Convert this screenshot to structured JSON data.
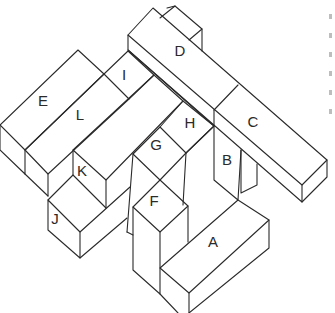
{
  "diagram": {
    "type": "isometric-block-arrangement",
    "blocks": [
      {
        "id": "A",
        "label": "A",
        "x": 213,
        "y": 243
      },
      {
        "id": "B",
        "label": "B",
        "x": 227,
        "y": 161
      },
      {
        "id": "C",
        "label": "C",
        "x": 253,
        "y": 123
      },
      {
        "id": "D",
        "label": "D",
        "x": 180,
        "y": 52
      },
      {
        "id": "E",
        "label": "E",
        "x": 43,
        "y": 102
      },
      {
        "id": "F",
        "label": "F",
        "x": 154,
        "y": 202
      },
      {
        "id": "G",
        "label": "G",
        "x": 156,
        "y": 146
      },
      {
        "id": "H",
        "label": "H",
        "x": 190,
        "y": 124
      },
      {
        "id": "I",
        "label": "I",
        "x": 124,
        "y": 76
      },
      {
        "id": "J",
        "label": "J",
        "x": 55,
        "y": 220
      },
      {
        "id": "K",
        "label": "K",
        "x": 82,
        "y": 172
      },
      {
        "id": "L",
        "label": "L",
        "x": 80,
        "y": 116
      }
    ],
    "stroke_color": "#2a2a2a",
    "background": "#ffffff"
  }
}
